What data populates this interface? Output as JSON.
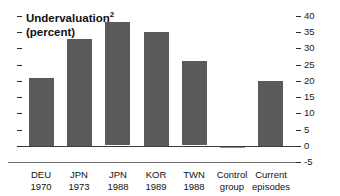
{
  "chart_data": {
    "type": "bar",
    "title": "Undervaluation",
    "title_superscript": "2",
    "subtitle": "(percent)",
    "xlabel": "",
    "ylabel": "",
    "ylim": [
      -5,
      40
    ],
    "yticks": [
      -5,
      0,
      5,
      10,
      15,
      20,
      25,
      30,
      35,
      40
    ],
    "ytick_labels": [
      "-5",
      "0",
      "5",
      "10",
      "15",
      "20",
      "25",
      "30",
      "35",
      "40"
    ],
    "y_axis_position": "right",
    "grid": false,
    "legend": false,
    "bar_color": "#5a5a5a",
    "categories": [
      {
        "line1": "DEU",
        "line2": "1970"
      },
      {
        "line1": "JPN",
        "line2": "1973"
      },
      {
        "line1": "JPN",
        "line2": "1988"
      },
      {
        "line1": "KOR",
        "line2": "1989"
      },
      {
        "line1": "TWN",
        "line2": "1988"
      },
      {
        "line1": "Control",
        "line2": "group"
      },
      {
        "line1": "Current",
        "line2": "episodes"
      }
    ],
    "values": [
      21,
      33,
      38,
      35,
      26,
      -0.5,
      20
    ]
  }
}
